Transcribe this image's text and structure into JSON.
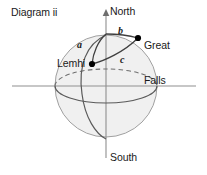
{
  "figure": {
    "title": "Diagram ii",
    "type": "sphere-spherical-triangle-diagram",
    "background_color": "#ffffff",
    "sphere": {
      "fill_color": "#f0f0f0",
      "outline_color": "#9a9a9a",
      "center_x": 106,
      "center_y": 86,
      "radius": 51
    },
    "axis_color": "#8c8c8c",
    "curve_color": "#4d4d4d",
    "point_color": "#000000",
    "text_color": "#1a1a1a"
  },
  "axes": {
    "vertical": {
      "name": "polar-axis",
      "north_label": "North",
      "south_label": "South",
      "arrow": "up-arrow",
      "x": 106,
      "y_top": 12,
      "y_bottom": 158
    },
    "horizontal": {
      "name": "equatorial-axis",
      "y": 86,
      "x_left": 12,
      "x_right": 196
    }
  },
  "points": [
    {
      "id": "lemhi",
      "label": "Lemhi",
      "x": 92,
      "y": 64,
      "marker": "filled-dot"
    },
    {
      "id": "great_falls",
      "label": "Great\nFalls",
      "label_line1": "Great",
      "label_line2": "Falls",
      "x": 138,
      "y": 38,
      "marker": "filled-dot"
    },
    {
      "id": "north_pole",
      "label": "",
      "x": 106,
      "y": 33,
      "marker": "none"
    }
  ],
  "arcs": [
    {
      "id": "a",
      "label": "a",
      "from": "lemhi",
      "to": "north_pole",
      "style": "solid"
    },
    {
      "id": "b",
      "label": "b",
      "from": "north_pole",
      "to": "great_falls",
      "style": "solid"
    },
    {
      "id": "c",
      "label": "c",
      "from": "lemhi",
      "to": "great_falls",
      "style": "solid"
    }
  ],
  "equator": {
    "name": "equator-ellipse",
    "front_style": "solid",
    "back_style": "dashed"
  },
  "meridian": {
    "name": "meridian-through-lemhi",
    "style": "solid",
    "passes_through": "lemhi"
  }
}
